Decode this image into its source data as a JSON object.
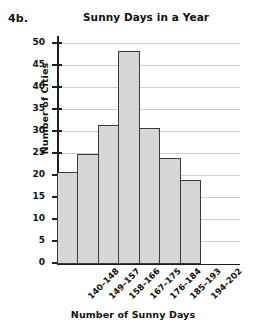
{
  "figure_label": "4b.",
  "chart_data": {
    "type": "bar",
    "title": "Sunny Days in a Year",
    "xlabel": "Number of Sunny Days",
    "ylabel": "Number of Cities",
    "categories": [
      "140–148",
      "149–157",
      "158–166",
      "167–175",
      "176–184",
      "185–193",
      "194–202"
    ],
    "values": [
      21,
      25,
      31.5,
      48.5,
      31,
      24,
      19
    ],
    "ylim": [
      0,
      50
    ],
    "ytick_labels": [
      "0",
      "5",
      "10",
      "15",
      "20",
      "25",
      "30",
      "35",
      "40",
      "45",
      "50"
    ],
    "ytick_values": [
      0,
      5,
      10,
      15,
      20,
      25,
      30,
      35,
      40,
      45,
      50
    ],
    "grid": true,
    "legend": "none",
    "bar_fill_color": "#d6d6d6",
    "bar_edge_color": "#3a3a3a",
    "grid_color": "#cfcfcf",
    "axis_color": "#1d1d1d"
  }
}
